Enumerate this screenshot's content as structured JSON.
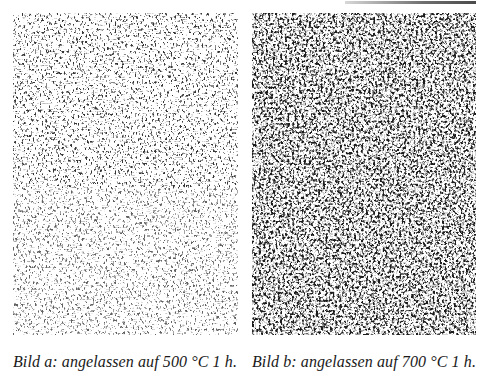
{
  "figure": {
    "panels": [
      {
        "id": "a",
        "label": "Bild a:",
        "caption": "Bild a: angelassen auf 500 °C 1 h.",
        "temperature_c": 500,
        "duration": "1 h",
        "texture_tone": "lighter, finer acicular structure",
        "ink_color": "#2a2a2a"
      },
      {
        "id": "b",
        "label": "Bild b:",
        "caption": "Bild b: angelassen auf 700 °C 1 h.",
        "temperature_c": 700,
        "duration": "1 h",
        "texture_tone": "darker, coarser denser structure",
        "ink_color": "#1a1a1a"
      }
    ]
  }
}
